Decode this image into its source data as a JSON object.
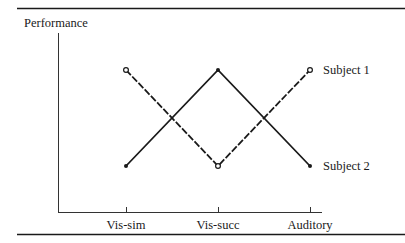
{
  "chart_data": {
    "type": "line",
    "title": "",
    "ylabel": "Performance",
    "xlabel": "",
    "categories": [
      "Vis-sim",
      "Vis-succ",
      "Auditory"
    ],
    "series": [
      {
        "name": "Subject 1",
        "values": [
          1,
          0,
          1
        ],
        "style": "dashed",
        "marker": "open-circle"
      },
      {
        "name": "Subject 2",
        "values": [
          0,
          1,
          0
        ],
        "style": "solid",
        "marker": "filled-circle"
      }
    ],
    "ylim": [
      -0.5,
      1.5
    ],
    "grid": false,
    "legend_position": "inline-right"
  },
  "colors": {
    "line": "#1a1a1a",
    "background": "#ffffff"
  }
}
